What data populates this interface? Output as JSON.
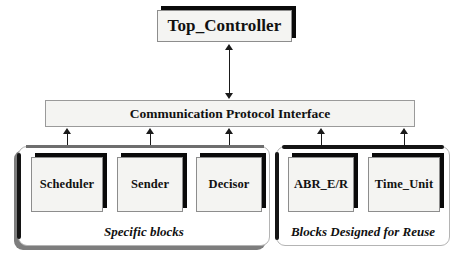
{
  "diagram": {
    "top_controller": {
      "label": "Top_Controller"
    },
    "interface_bar": {
      "label": "Communication Protocol Interface"
    },
    "groups": [
      {
        "id": "specific",
        "label": "Specific blocks",
        "blocks": [
          {
            "id": "scheduler",
            "label": "Scheduler"
          },
          {
            "id": "sender",
            "label": "Sender"
          },
          {
            "id": "decisor",
            "label": "Decisor"
          }
        ]
      },
      {
        "id": "reuse",
        "label": "Blocks Designed for Reuse",
        "blocks": [
          {
            "id": "abr",
            "label": "ABR_E/R"
          },
          {
            "id": "timeunit",
            "label": "Time_Unit"
          }
        ]
      }
    ],
    "connectors": [
      {
        "id": "top",
        "from": "Top_Controller",
        "to": "Communication Protocol Interface",
        "style": "double-headed-vertical-arrow"
      },
      {
        "id": "scheduler",
        "from": "Communication Protocol Interface",
        "to": "Scheduler",
        "style": "double-headed-vertical-arrow"
      },
      {
        "id": "sender",
        "from": "Communication Protocol Interface",
        "to": "Sender",
        "style": "double-headed-vertical-arrow"
      },
      {
        "id": "decisor",
        "from": "Communication Protocol Interface",
        "to": "Decisor",
        "style": "double-headed-vertical-arrow"
      },
      {
        "id": "abr",
        "from": "Communication Protocol Interface",
        "to": "ABR_E/R",
        "style": "double-headed-vertical-arrow"
      },
      {
        "id": "timeunit",
        "from": "Communication Protocol Interface",
        "to": "Time_Unit",
        "style": "double-headed-vertical-arrow"
      }
    ],
    "colors": {
      "background": "#ffffff",
      "box_fill": "#f4f4f2",
      "box_border": "#8d8d8d",
      "shadow": "#0a0a0a",
      "group_border": "#b4b4b4",
      "group_edge": "#141414",
      "text": "#111111",
      "arrow": "#1a1a1a"
    }
  }
}
